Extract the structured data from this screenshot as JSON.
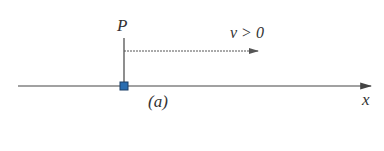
{
  "diagram": {
    "point_label": "P",
    "velocity_label": "v > 0",
    "axis_label": "x",
    "caption": "(a)",
    "colors": {
      "line": "#444444",
      "marker_fill": "#2a6db0",
      "marker_stroke": "#1b3f66"
    }
  }
}
